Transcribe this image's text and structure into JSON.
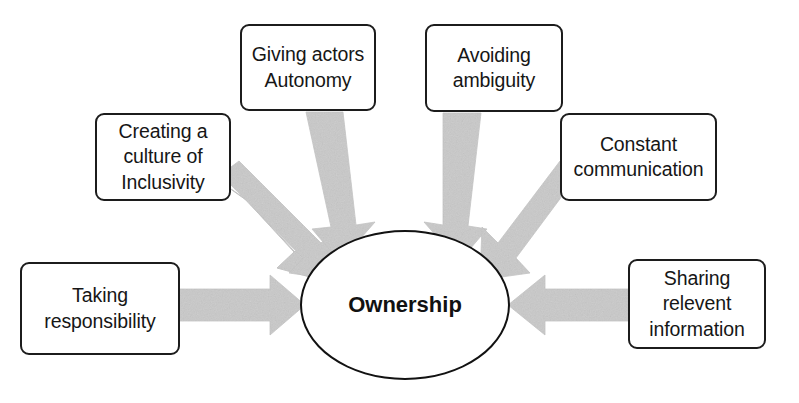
{
  "diagram": {
    "title_text": "Ownership",
    "type": "hub-and-spoke",
    "center": {
      "name": "ownership",
      "label": "Ownership",
      "shape": "ellipse",
      "cx": 405,
      "cy": 305,
      "rx": 105,
      "ry": 75
    },
    "colors": {
      "background": "#ffffff",
      "box_border": "#1c1c1c",
      "box_fill": "#ffffff",
      "text": "#161616",
      "arrow_fill": "#c9c9c9",
      "arrow_edge": "#bdbdbd",
      "ellipse_border": "#121212"
    },
    "nodes": [
      {
        "name": "creating-culture-of-inclusivity",
        "label": "Creating a culture of Inclusivity",
        "lines": [
          "Creating a",
          "culture of",
          "Inclusivity"
        ],
        "position": "upper-left",
        "arrow_direction": "down-right"
      },
      {
        "name": "giving-actors-autonomy",
        "label": "Giving actors Autonomy",
        "lines": [
          "Giving actors",
          "Autonomy"
        ],
        "position": "top-left-center",
        "arrow_direction": "down"
      },
      {
        "name": "avoiding-ambiguity",
        "label": "Avoiding ambiguity",
        "lines": [
          "Avoiding",
          "ambiguity"
        ],
        "position": "top-right-center",
        "arrow_direction": "down-left"
      },
      {
        "name": "constant-communication",
        "label": "Constant communication",
        "lines": [
          "Constant",
          "communication"
        ],
        "position": "upper-right",
        "arrow_direction": "down-left"
      },
      {
        "name": "taking-responsibility",
        "label": "Taking responsibility",
        "lines": [
          "Taking",
          "responsibility"
        ],
        "position": "left",
        "arrow_direction": "right"
      },
      {
        "name": "sharing-relevent-information",
        "label": "Sharing relevent information",
        "lines": [
          "Sharing",
          "relevent",
          "information"
        ],
        "position": "right",
        "arrow_direction": "left"
      }
    ]
  }
}
